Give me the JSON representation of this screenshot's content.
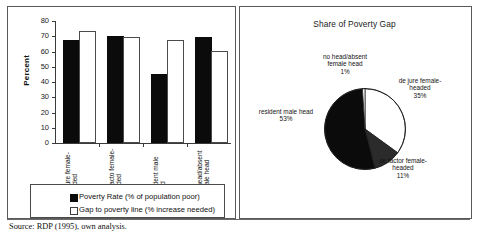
{
  "source_note": "Source: RDP (1995), own analysis.",
  "chart_data": [
    {
      "type": "bar",
      "title": "",
      "xlabel": "",
      "ylabel": "Percent",
      "ylim": [
        0,
        80
      ],
      "yticks": [
        "0",
        "10",
        "20",
        "30",
        "40",
        "50",
        "60",
        "70",
        "80"
      ],
      "grid": false,
      "legend_position": "bottom",
      "categories": [
        "de jure female-headed",
        "de facto female-headed",
        "resident male head",
        "no head/absent female head"
      ],
      "series": [
        {
          "name": "Poverty Rate (% of population poor)",
          "color": "#0b0b0b",
          "values": [
            66,
            69,
            44,
            68
          ]
        },
        {
          "name": "Gap to poverty line (% increase needed)",
          "color": "#ffffff",
          "values": [
            72,
            68,
            66,
            59
          ]
        }
      ]
    },
    {
      "type": "pie",
      "title": "Share of Poverty Gap",
      "labels": [
        "de jure female-headed",
        "de factor female-headed",
        "resident male head",
        "no head/absent female head"
      ],
      "values": [
        35,
        11,
        53,
        1
      ],
      "value_labels": [
        "35%",
        "11%",
        "53%",
        "1%"
      ],
      "colors": [
        "#ffffff",
        "#2b2b2b",
        "#0b0b0b",
        "#ffffff"
      ],
      "legend_position": "callout-labels"
    }
  ]
}
